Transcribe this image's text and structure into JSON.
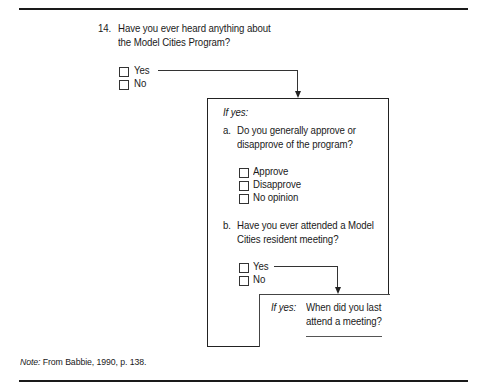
{
  "question": {
    "number": "14.",
    "text_line1": "Have you ever heard anything about",
    "text_line2": "the Model Cities Program?",
    "options": [
      "Yes",
      "No"
    ]
  },
  "followup_box": {
    "condition": "If yes:",
    "part_a": {
      "letter": "a.",
      "text_line1": "Do you generally approve or",
      "text_line2": "disapprove of the program?",
      "options": [
        "Approve",
        "Disapprove",
        "No opinion"
      ]
    },
    "part_b": {
      "letter": "b.",
      "text_line1": "Have you ever attended a Model",
      "text_line2": "Cities resident meeting?",
      "options": [
        "Yes",
        "No"
      ]
    },
    "sub_box": {
      "condition": "If yes:",
      "text_line1": "When did you last",
      "text_line2": "attend a meeting?"
    }
  },
  "note": {
    "label": "Note:",
    "text": " From Babbie, 1990, p. 138."
  }
}
